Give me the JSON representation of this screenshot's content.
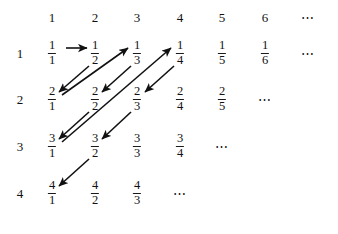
{
  "figure": {
    "background_color": "#ffffff",
    "ink_color": "#111111",
    "column_headers": [
      "1",
      "2",
      "3",
      "4",
      "5",
      "6",
      "⋯"
    ],
    "row_labels": [
      "1",
      "2",
      "3",
      "4"
    ],
    "ellipsis": "⋯",
    "grid": {
      "column_x": [
        52,
        95,
        137,
        180,
        222,
        265,
        308
      ],
      "row_y": [
        53,
        99,
        146,
        193
      ],
      "header_y": 17,
      "row_label_x": 20
    },
    "rows": [
      {
        "label": "1",
        "cells": [
          {
            "kind": "fraction",
            "numerator": "1",
            "denominator": "1"
          },
          {
            "kind": "fraction",
            "numerator": "1",
            "denominator": "2"
          },
          {
            "kind": "fraction",
            "numerator": "1",
            "denominator": "3"
          },
          {
            "kind": "fraction",
            "numerator": "1",
            "denominator": "4"
          },
          {
            "kind": "fraction",
            "numerator": "1",
            "denominator": "5"
          },
          {
            "kind": "fraction",
            "numerator": "1",
            "denominator": "6"
          },
          {
            "kind": "dots",
            "text": "⋯"
          }
        ]
      },
      {
        "label": "2",
        "cells": [
          {
            "kind": "fraction",
            "numerator": "2",
            "denominator": "1"
          },
          {
            "kind": "fraction",
            "numerator": "2",
            "denominator": "2"
          },
          {
            "kind": "fraction",
            "numerator": "2",
            "denominator": "3"
          },
          {
            "kind": "fraction",
            "numerator": "2",
            "denominator": "4"
          },
          {
            "kind": "fraction",
            "numerator": "2",
            "denominator": "5"
          },
          {
            "kind": "dots",
            "text": "⋯"
          }
        ]
      },
      {
        "label": "3",
        "cells": [
          {
            "kind": "fraction",
            "numerator": "3",
            "denominator": "1"
          },
          {
            "kind": "fraction",
            "numerator": "3",
            "denominator": "2"
          },
          {
            "kind": "fraction",
            "numerator": "3",
            "denominator": "3"
          },
          {
            "kind": "fraction",
            "numerator": "3",
            "denominator": "4"
          },
          {
            "kind": "dots",
            "text": "⋯"
          }
        ]
      },
      {
        "label": "4",
        "cells": [
          {
            "kind": "fraction",
            "numerator": "4",
            "denominator": "1"
          },
          {
            "kind": "fraction",
            "numerator": "4",
            "denominator": "2"
          },
          {
            "kind": "fraction",
            "numerator": "4",
            "denominator": "3"
          },
          {
            "kind": "dots",
            "text": "⋯"
          }
        ]
      }
    ],
    "arrows": [
      {
        "name": "arrow-1-1-to-1-2",
        "from": "1/1",
        "to": "1/2",
        "type": "horizontal-right",
        "x1": 66,
        "y1": 48,
        "x2": 87,
        "y2": 48
      },
      {
        "name": "arrow-1-2-to-2-1",
        "from": "1/2",
        "to": "2/1",
        "type": "diagonal-down-left",
        "x1": 89,
        "y1": 66,
        "x2": 59,
        "y2": 92
      },
      {
        "name": "arrow-2-1-to-1-3",
        "from": "2/1",
        "to": "1/3",
        "type": "diagonal-up-right",
        "x1": 62,
        "y1": 95,
        "x2": 128,
        "y2": 48
      },
      {
        "name": "arrow-1-3-to-2-2",
        "from": "1/3",
        "to": "2/2",
        "type": "diagonal-down-left",
        "x1": 131,
        "y1": 66,
        "x2": 102,
        "y2": 92
      },
      {
        "name": "arrow-2-2-to-3-1",
        "from": "2/2",
        "to": "3/1",
        "type": "diagonal-down-left",
        "x1": 89,
        "y1": 112,
        "x2": 59,
        "y2": 139
      },
      {
        "name": "arrow-3-1-to-1-4",
        "from": "3/1",
        "to": "1/4",
        "type": "diagonal-up-right",
        "x1": 62,
        "y1": 142,
        "x2": 171,
        "y2": 48
      },
      {
        "name": "arrow-1-4-to-2-3",
        "from": "1/4",
        "to": "2/3",
        "type": "diagonal-down-left",
        "x1": 174,
        "y1": 66,
        "x2": 145,
        "y2": 92
      },
      {
        "name": "arrow-2-3-to-3-2",
        "from": "2/3",
        "to": "3/2",
        "type": "diagonal-down-left",
        "x1": 131,
        "y1": 112,
        "x2": 102,
        "y2": 139
      },
      {
        "name": "arrow-3-2-to-4-1",
        "from": "3/2",
        "to": "4/1",
        "type": "diagonal-down-left",
        "x1": 89,
        "y1": 159,
        "x2": 59,
        "y2": 186
      }
    ]
  }
}
